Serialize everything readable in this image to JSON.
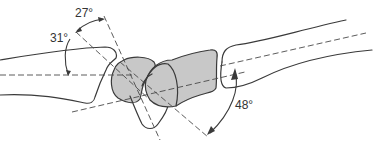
{
  "figure": {
    "type": "anatomical-angle-diagram",
    "labels": {
      "angle_a": "27°",
      "angle_b": "31°",
      "angle_c": "48°"
    },
    "colors": {
      "bone_outline": "#3a3a3a",
      "carpal_fill": "#c8c8c8",
      "axis_line": "#4a4a4a",
      "background": "#ffffff"
    }
  }
}
